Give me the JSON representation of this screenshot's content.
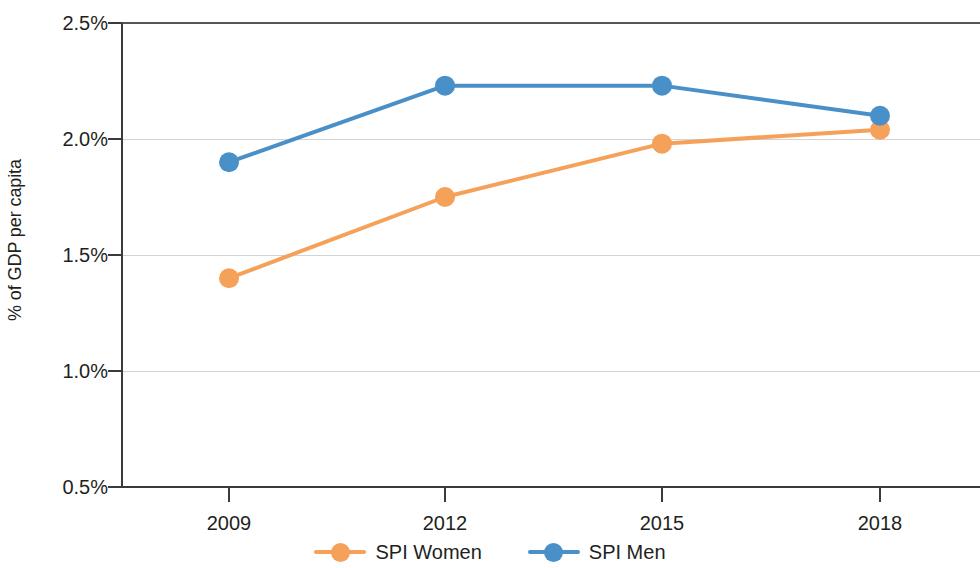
{
  "chart_data": {
    "type": "line",
    "title": "",
    "xlabel": "",
    "ylabel": "% of GDP per capita",
    "x": [
      2009,
      2012,
      2015,
      2018
    ],
    "categories": [
      "2009",
      "2012",
      "2015",
      "2018"
    ],
    "series": [
      {
        "name": "SPI Women",
        "color": "#f5a15a",
        "values": [
          1.4,
          1.75,
          1.98,
          2.04
        ]
      },
      {
        "name": "SPI Men",
        "color": "#4a90c8",
        "values": [
          1.9,
          2.23,
          2.23,
          2.1
        ]
      }
    ],
    "ylim": [
      0.5,
      2.5
    ],
    "ytick_labels": [
      "2.5%",
      "2.0%",
      "1.5%",
      "1.0%",
      "0.5%"
    ],
    "ytick_values": [
      2.5,
      2.0,
      1.5,
      1.0,
      0.5
    ],
    "grid": true,
    "legend_position": "bottom"
  },
  "axis": {
    "y_title": "% of GDP per capita",
    "y_ticks": [
      {
        "label": "2.5%",
        "value": 2.5
      },
      {
        "label": "2.0%",
        "value": 2.0
      },
      {
        "label": "1.5%",
        "value": 1.5
      },
      {
        "label": "1.0%",
        "value": 1.0
      },
      {
        "label": "0.5%",
        "value": 0.5
      }
    ],
    "x_ticks": [
      {
        "label": "2009",
        "value": 2009
      },
      {
        "label": "2012",
        "value": 2012
      },
      {
        "label": "2015",
        "value": 2015
      },
      {
        "label": "2018",
        "value": 2018
      }
    ]
  },
  "legend": {
    "items": [
      {
        "label": "SPI Women",
        "color": "#f5a15a"
      },
      {
        "label": "SPI Men",
        "color": "#4a90c8"
      }
    ]
  },
  "colors": {
    "women": "#f5a15a",
    "men": "#4a90c8",
    "axis": "#3b3b3b",
    "grid": "#d3d3d3",
    "text": "#231f20",
    "background": "#ffffff"
  }
}
